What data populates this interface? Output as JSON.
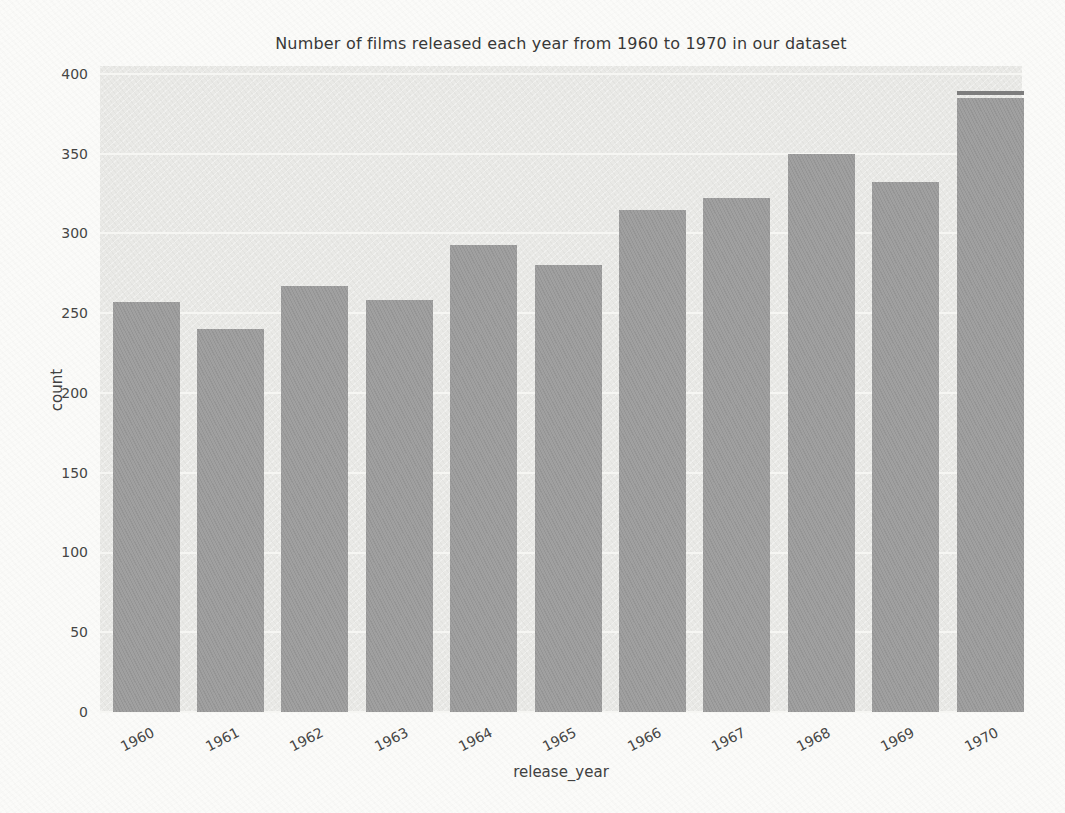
{
  "chart_data": {
    "type": "bar",
    "title": "Number of films released each year from 1960 to 1970 in our dataset",
    "xlabel": "release_year",
    "ylabel": "count",
    "categories": [
      "1960",
      "1961",
      "1962",
      "1963",
      "1964",
      "1965",
      "1966",
      "1967",
      "1968",
      "1969",
      "1970"
    ],
    "values": [
      257,
      240,
      267,
      258,
      293,
      280,
      315,
      322,
      350,
      332,
      385
    ],
    "yticks": [
      0,
      50,
      100,
      150,
      200,
      250,
      300,
      350,
      400
    ],
    "ylim": [
      0,
      405
    ],
    "grid": true,
    "legend": false,
    "x_tick_rotation_deg": -27,
    "bar_color": "#9b9b9b",
    "plot_background": "#e9e9e6",
    "gridline_color": "#f6f6f3",
    "text_color": "#3d3d3d",
    "artifact": {
      "target": "1970",
      "note": "thin dark cap line separated from bar top by white gap"
    }
  }
}
